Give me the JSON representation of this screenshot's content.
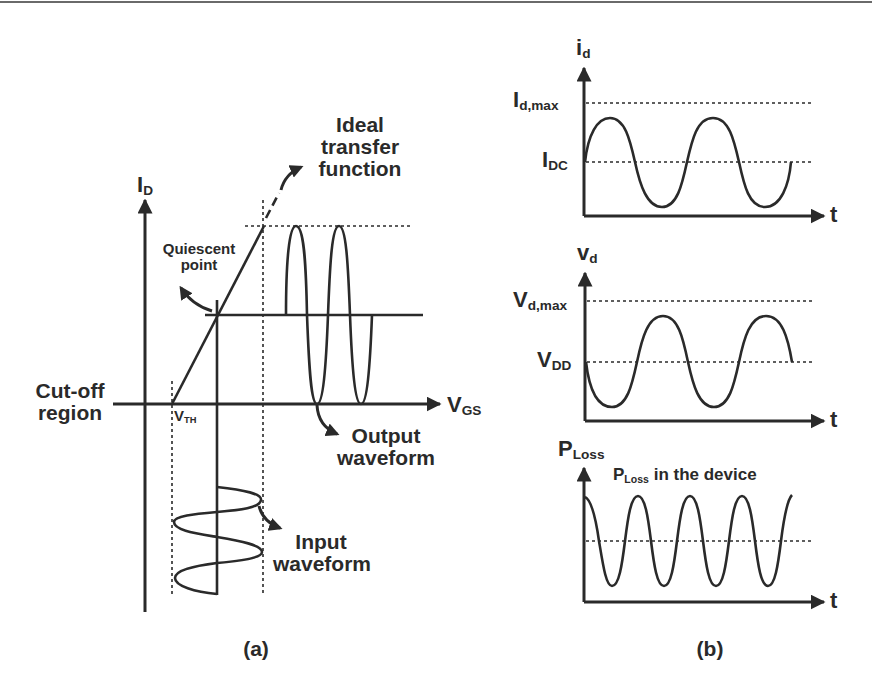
{
  "figure": {
    "panel_a": {
      "caption": "(a)",
      "y_axis_label": {
        "main": "I",
        "sub": "D"
      },
      "x_axis_label": {
        "main": "V",
        "sub": "GS"
      },
      "threshold_label": {
        "main": "V",
        "sub": "TH"
      },
      "annotations": {
        "ideal_transfer": [
          "Ideal",
          "transfer",
          "function"
        ],
        "quiescent": [
          "Quiescent",
          "point"
        ],
        "cutoff": [
          "Cut-off",
          "region"
        ],
        "output": [
          "Output",
          "waveform"
        ],
        "input": [
          "Input",
          "waveform"
        ]
      }
    },
    "panel_b": {
      "caption": "(b)",
      "plots": [
        {
          "name": "drain-current",
          "y_label": {
            "main": "i",
            "sub": "d"
          },
          "x_label": "t",
          "levels": [
            {
              "main": "I",
              "sub": "d,max"
            },
            {
              "main": "I",
              "sub": "DC"
            }
          ]
        },
        {
          "name": "drain-voltage",
          "y_label": {
            "main": "v",
            "sub": "d"
          },
          "x_label": "t",
          "levels": [
            {
              "main": "V",
              "sub": "d,max"
            },
            {
              "main": "V",
              "sub": "DD"
            }
          ]
        },
        {
          "name": "power-loss",
          "y_label": {
            "main": "P",
            "sub": "Loss"
          },
          "x_label": "t",
          "annotation": {
            "main": "P",
            "sub": "Loss",
            "rest": " in the device"
          }
        }
      ]
    },
    "colors": {
      "ink": "#2a2a2a",
      "background": "#ffffff"
    }
  }
}
